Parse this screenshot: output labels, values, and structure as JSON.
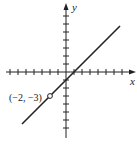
{
  "chart_data": {
    "type": "line",
    "title": "",
    "xlabel": "x",
    "ylabel": "y",
    "xlim": [
      -7.5,
      8
    ],
    "ylim": [
      -7.5,
      8
    ],
    "grid": false,
    "tick_spacing": 1,
    "x_ticks": [
      -7,
      -6,
      -5,
      -4,
      -3,
      -2,
      -1,
      1,
      2,
      3,
      4,
      5,
      6,
      7
    ],
    "y_ticks": [
      -7,
      -6,
      -5,
      -4,
      -3,
      -2,
      -1,
      1,
      2,
      3,
      4,
      5,
      6,
      7
    ],
    "series": [
      {
        "name": "y = x - 1",
        "x": [
          -5.5,
          6.75
        ],
        "y": [
          -6.5,
          5.75
        ],
        "color": "#222222"
      }
    ],
    "annotations": [
      {
        "text": "(−2, −3)",
        "x": -2,
        "y": -3,
        "marker": "open-circle"
      }
    ]
  },
  "labels": {
    "x_axis": "x",
    "y_axis": "y",
    "point": "(−2, −3)"
  }
}
